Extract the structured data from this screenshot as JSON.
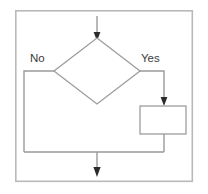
{
  "diagram": {
    "type": "flowchart",
    "title": "",
    "background_color": "#ffffff",
    "frame": {
      "name": "outer-frame",
      "x": 15,
      "y": 10,
      "width": 178,
      "height": 172,
      "stroke_color": "#b9b9b9",
      "fill_color": "#ffffff"
    },
    "colors": {
      "shape_stroke": "#9d9d9d",
      "connector_stroke": "#9a9a9a",
      "arrowhead": "#2b2b2b",
      "label_text": "#3b3b3b",
      "frame_stroke": "#b9b9b9"
    },
    "nodes": [
      {
        "name": "decision-diamond",
        "shape": "diamond",
        "label": "",
        "cx": 97,
        "cy": 71,
        "half_width": 43,
        "half_height": 33
      },
      {
        "name": "process-box",
        "shape": "rectangle",
        "label": "",
        "x": 140,
        "y": 106,
        "width": 46,
        "height": 28
      }
    ],
    "labels": [
      {
        "name": "branch-label-no",
        "text": "No",
        "x": 30,
        "y": 62
      },
      {
        "name": "branch-label-yes",
        "text": "Yes",
        "x": 141,
        "y": 62
      }
    ],
    "connectors": [
      {
        "name": "entry-arrow",
        "from": "top-edge",
        "to": "decision-diamond",
        "path": "M 97 16 L 97 36",
        "arrow_at_end": true,
        "arrow_direction": "down",
        "arrow_x": 97,
        "arrow_y": 38
      },
      {
        "name": "no-branch-connector",
        "from": "decision-diamond",
        "to": "merge-line",
        "path": "M 54 71 L 24 71 L 24 152",
        "arrow_at_end": false
      },
      {
        "name": "yes-branch-connector",
        "from": "decision-diamond",
        "to": "process-box",
        "path": "M 140 71 L 164 71 L 164 102",
        "arrow_at_end": true,
        "arrow_direction": "down",
        "arrow_x": 164,
        "arrow_y": 104
      },
      {
        "name": "process-to-merge-connector",
        "from": "process-box",
        "to": "merge-line",
        "path": "M 164 134 L 164 152",
        "arrow_at_end": false
      },
      {
        "name": "merge-line",
        "from": "no-branch-connector",
        "to": "process-to-merge-connector",
        "path": "M 24 152 L 164 152",
        "arrow_at_end": false
      },
      {
        "name": "exit-arrow",
        "from": "merge-line",
        "to": "bottom-edge",
        "path": "M 97 152 L 97 172",
        "arrow_at_end": true,
        "arrow_direction": "down",
        "arrow_x": 97,
        "arrow_y": 175
      }
    ]
  }
}
